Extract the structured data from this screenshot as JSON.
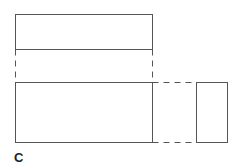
{
  "diagram": {
    "label": "C",
    "shapes": [
      {
        "name": "top-rectangle",
        "style": "solid"
      },
      {
        "name": "bottom-rectangle",
        "style": "solid"
      },
      {
        "name": "side-rectangle",
        "style": "solid"
      }
    ],
    "connectors": [
      {
        "name": "left-vertical-projection",
        "style": "dashed"
      },
      {
        "name": "right-vertical-projection",
        "style": "dashed"
      },
      {
        "name": "top-horizontal-projection",
        "style": "dashed"
      },
      {
        "name": "bottom-horizontal-projection",
        "style": "dashed"
      }
    ],
    "colors": {
      "line": "#555555",
      "background": "#ffffff"
    }
  }
}
